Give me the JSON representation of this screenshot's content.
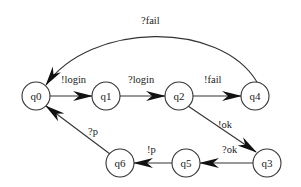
{
  "diagram": {
    "type": "state-machine",
    "nodes": [
      {
        "id": "q0",
        "label": "q0",
        "x": 36,
        "y": 96
      },
      {
        "id": "q1",
        "label": "q1",
        "x": 106,
        "y": 96
      },
      {
        "id": "q2",
        "label": "q2",
        "x": 179,
        "y": 96
      },
      {
        "id": "q4",
        "label": "q4",
        "x": 255,
        "y": 96
      },
      {
        "id": "q3",
        "label": "q3",
        "x": 267,
        "y": 163
      },
      {
        "id": "q5",
        "label": "q5",
        "x": 186,
        "y": 163
      },
      {
        "id": "q6",
        "label": "q6",
        "x": 120,
        "y": 163
      }
    ],
    "edges": [
      {
        "from": "q0",
        "to": "q1",
        "label": "!login"
      },
      {
        "from": "q1",
        "to": "q2",
        "label": "?login"
      },
      {
        "from": "q2",
        "to": "q4",
        "label": "!fail"
      },
      {
        "from": "q4",
        "to": "q0",
        "label": "?fail"
      },
      {
        "from": "q2",
        "to": "q3",
        "label": "!ok"
      },
      {
        "from": "q3",
        "to": "q5",
        "label": "?ok"
      },
      {
        "from": "q5",
        "to": "q6",
        "label": "!p"
      },
      {
        "from": "q6",
        "to": "q0",
        "label": "?p"
      }
    ]
  },
  "labels": {
    "q0": "q0",
    "q1": "q1",
    "q2": "q2",
    "q3": "q3",
    "q4": "q4",
    "q5": "q5",
    "q6": "q6",
    "e_q0_q1": "!login",
    "e_q1_q2": "?login",
    "e_q2_q4": "!fail",
    "e_q4_q0": "?fail",
    "e_q2_q3": "!ok",
    "e_q3_q5": "?ok",
    "e_q5_q6": "!p",
    "e_q6_q0": "?p"
  }
}
